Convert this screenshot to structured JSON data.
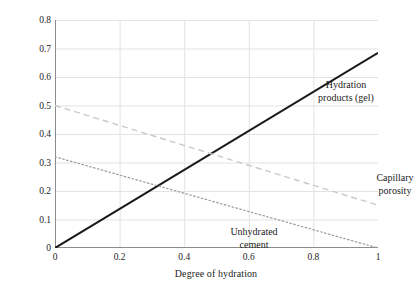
{
  "chart_data": {
    "type": "line",
    "title": "",
    "xlabel": "Degree of hydration",
    "ylabel": "Volume/g of cement",
    "xlim": [
      0,
      1
    ],
    "ylim": [
      0,
      0.8
    ],
    "grid": true,
    "legend_position": "inline-annotations",
    "x_ticks": [
      "0",
      "0.2",
      "0.4",
      "0.6",
      "0.8",
      "1"
    ],
    "x_tick_values": [
      0,
      0.2,
      0.4,
      0.6,
      0.8,
      1
    ],
    "y_ticks": [
      "0",
      "0.1",
      "0.2",
      "0.3",
      "0.4",
      "0.5",
      "0.6",
      "0.7",
      "0.8"
    ],
    "y_tick_values": [
      0,
      0.1,
      0.2,
      0.3,
      0.4,
      0.5,
      0.6,
      0.7,
      0.8
    ],
    "x": [
      0,
      1
    ],
    "series": [
      {
        "name": "Hydration products (gel)",
        "style": "solid",
        "color": "#1a1a1a",
        "width": 2.0,
        "values": [
          0.0,
          0.685
        ]
      },
      {
        "name": "Capillary porosity",
        "style": "dashed",
        "color": "#c9c9c9",
        "width": 1.4,
        "values": [
          0.5,
          0.15
        ]
      },
      {
        "name": "Unhydrated cement",
        "style": "dotted",
        "color": "#9a9a9a",
        "width": 1.2,
        "values": [
          0.32,
          0.0
        ]
      }
    ],
    "annotations": [
      {
        "id": "hydration",
        "text": "Hydration\nproducts (gel)",
        "x": 0.64,
        "y": 0.625
      },
      {
        "id": "capillary",
        "text": "Capillary\nporosity",
        "x": 0.87,
        "y": 0.31
      },
      {
        "id": "unhydrated",
        "text": "Unhydrated\ncement",
        "x": 0.37,
        "y": 0.125
      }
    ]
  },
  "axes": {
    "x_title": "Degree of hydration",
    "y_title": "Volume/g of cement",
    "x_tick_labels": [
      "0",
      "0.2",
      "0.4",
      "0.6",
      "0.8",
      "1"
    ],
    "y_tick_labels": [
      "0.8",
      "0.7",
      "0.6",
      "0.5",
      "0.4",
      "0.3",
      "0.2",
      "0.1",
      "0"
    ]
  },
  "annotations": {
    "hydration": "Hydration\nproducts (gel)",
    "capillary": "Capillary\nporosity",
    "unhydrated": "Unhydrated\ncement"
  },
  "colors": {
    "background": "#ffffff",
    "axis": "#8c8c8c",
    "grid": "#e3e3e3",
    "text": "#1c1c1c",
    "series_solid": "#1a1a1a",
    "series_dashed": "#c9c9c9",
    "series_dotted": "#9a9a9a"
  }
}
